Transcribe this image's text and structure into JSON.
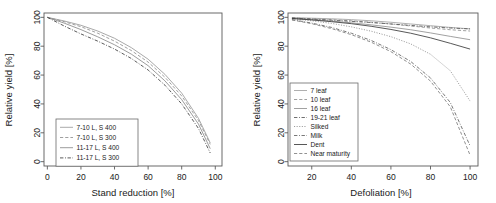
{
  "figure": {
    "panels": [
      "left",
      "right"
    ],
    "background": "#ffffff",
    "axis_color": "#5a5a5a"
  },
  "chart_data": [
    {
      "type": "line",
      "panel": "left",
      "title": "",
      "xlabel": "Stand reduction [%]",
      "ylabel": "Relative yield [%]",
      "xlim": [
        -2,
        104
      ],
      "ylim": [
        -3,
        103
      ],
      "xticks": [
        0,
        20,
        40,
        60,
        80,
        100
      ],
      "yticks": [
        0,
        20,
        40,
        60,
        80,
        100
      ],
      "grid": false,
      "legend_position": "bottom-left",
      "x": [
        0,
        10,
        20,
        30,
        40,
        50,
        60,
        70,
        80,
        90,
        97
      ],
      "series": [
        {
          "name": "7-10 L, S 400",
          "color": "#9a9a9a",
          "dash": "none",
          "values": [
            100,
            97.5,
            94.5,
            90.5,
            85.5,
            79.0,
            71.0,
            60.5,
            47.5,
            30.0,
            13.0
          ]
        },
        {
          "name": "7-10 L, S 300",
          "color": "#8f8f8f",
          "dash": "dashed",
          "values": [
            100,
            97.0,
            93.5,
            89.0,
            83.5,
            77.0,
            69.0,
            58.5,
            45.5,
            28.5,
            12.0
          ]
        },
        {
          "name": "11-17 L, S 400",
          "color": "#8a8a8a",
          "dash": "none",
          "values": [
            100,
            96.0,
            91.5,
            86.5,
            81.0,
            74.5,
            66.5,
            56.0,
            43.0,
            26.0,
            9.0
          ]
        },
        {
          "name": "11-17 L, S 300",
          "color": "#3c3c3c",
          "dash": "dashdot",
          "values": [
            100,
            94.0,
            88.5,
            83.5,
            78.0,
            71.5,
            63.5,
            53.0,
            40.0,
            23.0,
            6.0
          ]
        }
      ]
    },
    {
      "type": "line",
      "panel": "right",
      "title": "",
      "xlabel": "Defoliation [%]",
      "ylabel": "Relative yield [%]",
      "xlim": [
        8,
        104
      ],
      "ylim": [
        -3,
        103
      ],
      "xticks": [
        20,
        40,
        60,
        80,
        100
      ],
      "yticks": [
        0,
        20,
        40,
        60,
        80,
        100
      ],
      "grid": false,
      "legend_position": "left-center",
      "x": [
        10,
        20,
        30,
        40,
        50,
        60,
        70,
        80,
        90,
        100
      ],
      "series": [
        {
          "name": "7 leaf",
          "color": "#a0a0a0",
          "dash": "none",
          "values": [
            99.8,
            99.4,
            99.0,
            98.4,
            97.6,
            96.6,
            95.4,
            94.2,
            93.0,
            92.0
          ]
        },
        {
          "name": "10 leaf",
          "color": "#8f8f8f",
          "dash": "dashed",
          "values": [
            99.6,
            99.0,
            98.4,
            97.6,
            96.6,
            95.4,
            94.0,
            92.6,
            91.4,
            90.5
          ]
        },
        {
          "name": "16 leaf",
          "color": "#909090",
          "dash": "none",
          "values": [
            99.3,
            98.4,
            97.4,
            96.2,
            94.8,
            93.2,
            91.4,
            89.2,
            86.8,
            84.5
          ]
        },
        {
          "name": "19-21 leaf",
          "color": "#555555",
          "dash": "dashdot",
          "values": [
            99.5,
            98.8,
            98.0,
            97.2,
            96.4,
            95.4,
            94.4,
            93.4,
            92.6,
            92.0
          ]
        },
        {
          "name": "Silked",
          "color": "#8a8a8a",
          "dash": "dotted",
          "values": [
            99.0,
            97.6,
            95.8,
            93.4,
            90.4,
            86.6,
            81.6,
            74.4,
            63.0,
            42.0
          ]
        },
        {
          "name": "Milk",
          "color": "#606060",
          "dash": "dashdot",
          "values": [
            98.4,
            96.0,
            93.0,
            89.0,
            84.0,
            77.6,
            69.4,
            58.0,
            41.0,
            11.0
          ]
        },
        {
          "name": "Dent",
          "color": "#3a3a3a",
          "dash": "none",
          "values": [
            99.2,
            98.2,
            97.0,
            95.6,
            93.8,
            91.6,
            89.0,
            85.8,
            82.0,
            78.0
          ]
        },
        {
          "name": "Near maturity",
          "color": "#7d7d7d",
          "dash": "dashed",
          "values": [
            98.2,
            95.6,
            92.2,
            88.0,
            82.8,
            76.2,
            67.6,
            55.8,
            38.0,
            4.5
          ]
        }
      ]
    }
  ],
  "left_panel": {
    "xlabel": "Stand reduction [%]",
    "ylabel": "Relative yield [%]",
    "xticks": [
      "0",
      "20",
      "40",
      "60",
      "80",
      "100"
    ],
    "yticks": [
      "0",
      "20",
      "40",
      "60",
      "80",
      "100"
    ],
    "legend": [
      "7-10 L, S 400",
      "7-10 L, S 300",
      "11-17 L, S 400",
      "11-17 L, S 300"
    ]
  },
  "right_panel": {
    "xlabel": "Defoliation [%]",
    "ylabel": "Relative yield [%]",
    "xticks": [
      "20",
      "40",
      "60",
      "80",
      "100"
    ],
    "yticks": [
      "0",
      "20",
      "40",
      "60",
      "80",
      "100"
    ],
    "legend": [
      "7 leaf",
      "10 leaf",
      "16 leaf",
      "19-21 leaf",
      "Silked",
      "Milk",
      "Dent",
      "Near maturity"
    ]
  }
}
